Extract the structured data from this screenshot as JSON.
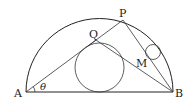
{
  "diagram": {
    "type": "geometry",
    "labels": {
      "A": "A",
      "B": "B",
      "P": "P",
      "Q": "Q",
      "M": "M",
      "theta": "θ"
    },
    "points": {
      "A": [
        26,
        92
      ],
      "B": [
        173,
        92
      ],
      "P": [
        123,
        20
      ],
      "Q": [
        96,
        40
      ],
      "M": [
        146,
        58
      ]
    },
    "semicircle": {
      "center": [
        99.5,
        92
      ],
      "radius": 73.5
    },
    "big_circle": {
      "center": [
        99.5,
        67.5
      ],
      "radius": 24.5
    },
    "small_circle": {
      "center": [
        153,
        52
      ],
      "radius": 7.5
    },
    "colors": {
      "line": "#222222",
      "background": "#ffffff"
    }
  }
}
